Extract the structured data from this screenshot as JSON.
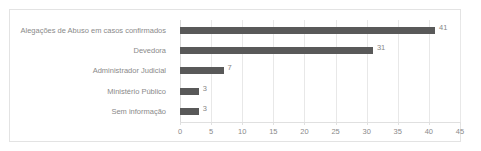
{
  "chart_data": {
    "type": "bar",
    "orientation": "horizontal",
    "title": "",
    "subtitle": "",
    "xlabel": "",
    "ylabel": "",
    "categories": [
      "Alegações de Abuso em casos confirmados",
      "Devedora",
      "Administrador Judicial",
      "Ministério Público",
      "Sem informação"
    ],
    "values": [
      41,
      31,
      7,
      3,
      3
    ],
    "data_labels": [
      "41",
      "31",
      "7",
      "3",
      "3"
    ],
    "xticks": [
      0,
      5,
      10,
      15,
      20,
      25,
      30,
      35,
      40,
      45
    ],
    "xtick_labels": [
      "0",
      "5",
      "10",
      "15",
      "20",
      "25",
      "30",
      "35",
      "40",
      "45"
    ],
    "xlim": [
      0,
      45
    ],
    "grid": "vertical",
    "legend": "none",
    "bar_color": "#595959",
    "gridline_color": "#e8e8e8",
    "text_color": "#8a8a8a",
    "frame_color": "#e3e3e3",
    "background_color": "#ffffff"
  }
}
